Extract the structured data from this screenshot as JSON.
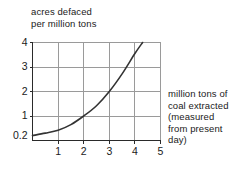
{
  "chart_data": {
    "type": "line",
    "title": "",
    "ylabel": "acres defaced\nper million tons",
    "ylabel_line1": "acres defaced",
    "ylabel_line2": "per million tons",
    "xlabel": "million tons of\ncoal extracted\n(measured\nfrom present\nday)",
    "xlabel_line1": "million tons of",
    "xlabel_line2": "coal extracted",
    "xlabel_line3": "(measured",
    "xlabel_line4": "from present",
    "xlabel_line5": "day)",
    "xlim": [
      0,
      5
    ],
    "ylim": [
      0,
      4
    ],
    "xticks": [
      "1",
      "2",
      "3",
      "4",
      "5"
    ],
    "xtick_values": [
      1,
      2,
      3,
      4,
      5
    ],
    "yticks": [
      "0.2",
      "1",
      "2",
      "3",
      "4"
    ],
    "ytick_values": [
      0.2,
      1,
      2,
      3,
      4
    ],
    "grid": true,
    "legend": "none",
    "series": [
      {
        "name": "acres defaced per million tons",
        "x": [
          0,
          0.5,
          1,
          1.5,
          2,
          2.5,
          3,
          3.5,
          4,
          4.3
        ],
        "values": [
          0.2,
          0.3,
          0.42,
          0.65,
          1.0,
          1.42,
          2.0,
          2.72,
          3.55,
          4.0
        ],
        "color": "#333333"
      }
    ],
    "annotations": [
      "curve starts at (0, 0.2) on the y-axis",
      "curve passes through (2, 1)",
      "curve passes through (3, 2)",
      "curve exits top of plot near (4.3, 4)"
    ]
  },
  "colors": {
    "background": "#ffffff",
    "axis": "#2a2a2a",
    "grid": "#9a9a9a",
    "curve": "#333333",
    "text": "#1a1a1a"
  }
}
